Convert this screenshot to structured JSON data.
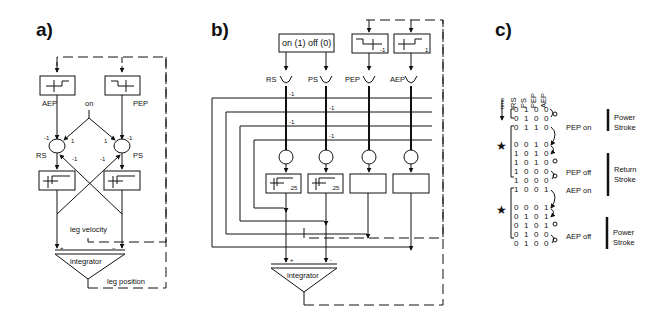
{
  "panels": {
    "a": {
      "label": "a)",
      "detectors": {
        "aep": "AEP",
        "pep": "PEP"
      },
      "input": "on",
      "neurons": {
        "rs": "RS",
        "ps": "PS"
      },
      "weights": {
        "aep_rs": "-1",
        "on_rs": "1",
        "on_ps": "1",
        "pep_ps": "-1",
        "ps_rs": "-1",
        "rs_ps": "-1"
      },
      "velocity_label": "leg velocity",
      "integrator": "integrator",
      "integrator_plus": "+",
      "integrator_minus": "–",
      "position_label": "leg position"
    },
    "b": {
      "label": "b)",
      "input_box": "on (1)  off (0)",
      "pep_threshold": "-1",
      "aep_threshold": "1",
      "units": [
        "RS",
        "PS",
        "PEP",
        "AEP"
      ],
      "weights": [
        "-1",
        "-1",
        "-1",
        "-1"
      ],
      "gain_rs": ".25",
      "gain_ps": ".25",
      "integrator": "integrator",
      "integrator_plus": "+",
      "integrator_minus": "-"
    },
    "c": {
      "label": "c)",
      "columns": [
        "RS",
        "PS",
        "PEP",
        "AEP"
      ],
      "time_label": "time",
      "rows": [
        [
          "0",
          "1",
          "0",
          "0"
        ],
        [
          "0",
          "1",
          "0",
          "0"
        ],
        [
          "0",
          "1",
          "1",
          "0"
        ],
        [
          "0",
          "0",
          "1",
          "0"
        ],
        [
          "1",
          "0",
          "1",
          "0"
        ],
        [
          "1",
          "0",
          "1",
          "0"
        ],
        [
          "1",
          "0",
          "0",
          "0"
        ],
        [
          "1",
          "0",
          "0",
          "0"
        ],
        [
          "1",
          "0",
          "0",
          "1"
        ],
        [
          "0",
          "0",
          "0",
          "1"
        ],
        [
          "0",
          "1",
          "0",
          "1"
        ],
        [
          "0",
          "1",
          "0",
          "1"
        ],
        [
          "0",
          "1",
          "0",
          "0"
        ],
        [
          "0",
          "1",
          "0",
          "0"
        ]
      ],
      "events": {
        "pep_on": "PEP on",
        "pep_off": "PEP off",
        "aep_on": "AEP on",
        "aep_off": "AEP off"
      },
      "phases": [
        {
          "line1": "Power",
          "line2": "Stroke"
        },
        {
          "line1": "Return",
          "line2": "Stroke"
        },
        {
          "line1": "Power",
          "line2": "Stroke"
        }
      ],
      "star": "★"
    }
  }
}
